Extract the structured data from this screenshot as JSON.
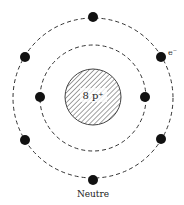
{
  "diagram": {
    "type": "atom-bohr-model",
    "nucleus": {
      "label": "8 p⁺",
      "fill_pattern": "hatched",
      "color": "#333333"
    },
    "orbits": [
      {
        "name": "inner-shell",
        "electrons": 2
      },
      {
        "name": "outer-shell",
        "electrons": 6
      }
    ],
    "electron_label": "e⁻",
    "caption": "Neutre"
  }
}
